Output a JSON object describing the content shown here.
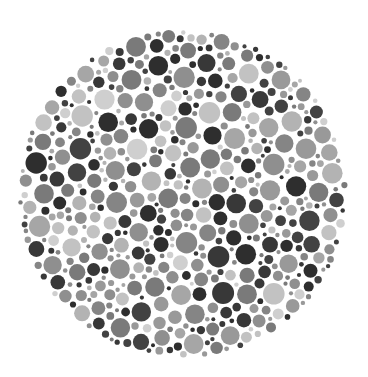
{
  "plate": {
    "type": "color-vision-test-plate",
    "rendering": "grayscale dot pattern",
    "background": "#ffffff",
    "center": [
      183,
      194
    ],
    "radius": 165,
    "palette": {
      "dark": [
        "#2e2e2e",
        "#383838",
        "#424242"
      ],
      "medium": [
        "#7a7a7a",
        "#858585",
        "#8f8f8f",
        "#999999"
      ],
      "light": [
        "#a6a6a6",
        "#b3b3b3",
        "#c2c2c2",
        "#cfcfcf"
      ]
    },
    "weights": {
      "dark": 0.28,
      "medium": 0.45,
      "light": 0.27
    },
    "dot_radius_range": [
      2,
      11
    ],
    "seed": 20240611
  }
}
